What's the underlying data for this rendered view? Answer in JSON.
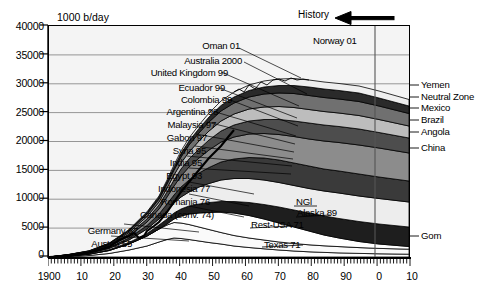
{
  "chart_data": {
    "type": "area",
    "title": "",
    "ylabel": "1000 b/day",
    "xlabel": "",
    "ylim": [
      0,
      40000
    ],
    "xlim": [
      1900,
      2010
    ],
    "grid": true,
    "legend_position": "right-margin",
    "yticks": [
      "0",
      "5000",
      "10000",
      "15000",
      "20000",
      "25000",
      "30000",
      "35000",
      "40000"
    ],
    "ytick_values": [
      0,
      5000,
      10000,
      15000,
      20000,
      25000,
      30000,
      35000,
      40000
    ],
    "xticks": [
      "1900",
      "10",
      "20",
      "30",
      "40",
      "50",
      "60",
      "70",
      "80",
      "90",
      "0",
      "10"
    ],
    "xtick_values": [
      1900,
      1910,
      1920,
      1930,
      1940,
      1950,
      1960,
      1970,
      1980,
      1990,
      2000,
      2010
    ],
    "history_marker": {
      "label": "History",
      "arrow": "left",
      "boundary_year": 2005
    },
    "total_series": {
      "name": "World total liquids",
      "x": [
        1900,
        1905,
        1910,
        1915,
        1920,
        1925,
        1930,
        1935,
        1940,
        1945,
        1950,
        1955,
        1960,
        1965,
        1970,
        1973,
        1975,
        1979,
        1982,
        1985,
        1990,
        1993,
        1996,
        2000,
        2003,
        2005,
        2006,
        2008,
        2010
      ],
      "y": [
        400,
        700,
        1100,
        1400,
        2000,
        2700,
        3900,
        4100,
        5500,
        6000,
        10500,
        15000,
        21000,
        28500,
        45000,
        55000,
        53000,
        62000,
        57000,
        54000,
        60000,
        60000,
        63000,
        68000,
        69000,
        72500,
        72000,
        71500,
        68000
      ]
    },
    "peak_callouts_left": [
      {
        "label": "Oman 01",
        "year": 2001
      },
      {
        "label": "Australia 2000",
        "year": 2000
      },
      {
        "label": "United Kingdom 99",
        "year": 1999
      },
      {
        "label": "Ecuador 99",
        "year": 1999
      },
      {
        "label": "Colombia 99",
        "year": 1999
      },
      {
        "label": "Argentina 98",
        "year": 1998
      },
      {
        "label": "Malaysia 97",
        "year": 1997
      },
      {
        "label": "Gabon 97",
        "year": 1997
      },
      {
        "label": "Syria 95",
        "year": 1995
      },
      {
        "label": "India 95",
        "year": 1995
      },
      {
        "label": "Egypt 93",
        "year": 1993
      },
      {
        "label": "Indonesia 77",
        "year": 1977
      },
      {
        "label": "Romania 76",
        "year": 1976
      },
      {
        "label": "Canada (conv. 74)",
        "year": 1974
      },
      {
        "label": "Germany 67",
        "year": 1967
      },
      {
        "label": "Austria 55",
        "year": 1955
      }
    ],
    "peak_callouts_inner": [
      {
        "label": "Norway 01",
        "year": 2001
      },
      {
        "label": "NGl",
        "year": null
      },
      {
        "label": "Alaska 89",
        "year": 1989
      },
      {
        "label": "Rest-USA 71",
        "year": 1971
      },
      {
        "label": "Texas 71",
        "year": 1971
      }
    ],
    "right_margin_labels": [
      {
        "label": "Yemen"
      },
      {
        "label": "Neutral Zone"
      },
      {
        "label": "Mexico"
      },
      {
        "label": "Brazil"
      },
      {
        "label": "Angola"
      },
      {
        "label": "China"
      },
      {
        "label": "Gom"
      }
    ],
    "annotations": [
      "History"
    ]
  },
  "colors": {
    "plot_background": "#f4f4f4",
    "axis": "#000000",
    "grid": "#777777",
    "text": "#000000",
    "band_light": "#f2f2f2",
    "band_mid": "#9a9a9a",
    "band_dark": "#2b2b2b"
  }
}
